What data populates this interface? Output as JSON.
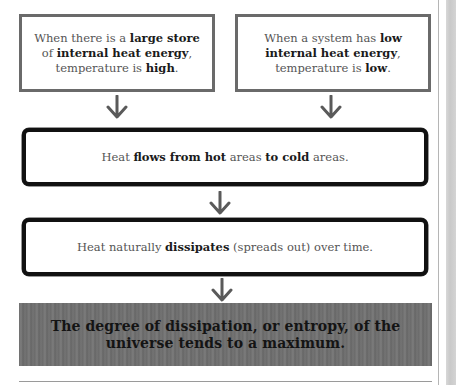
{
  "diagram": {
    "boxes": {
      "high_energy": {
        "prefix": "When there is a ",
        "bold1": "large store",
        "mid1": " of ",
        "bold2": "internal heat energy",
        "mid2": ", temperature is ",
        "bold3": "high",
        "suffix": "."
      },
      "low_energy": {
        "prefix": "When a system has ",
        "bold1": "low internal heat energy",
        "mid1": ", temperature is ",
        "bold2": "low",
        "suffix": "."
      },
      "heat_flow": {
        "prefix": "Heat ",
        "bold1": "flows from hot",
        "mid1": " areas ",
        "bold2": "to cold",
        "suffix": " areas."
      },
      "dissipation": {
        "prefix": "Heat naturally ",
        "bold1": "dissipates",
        "suffix": " (spreads out) over time."
      }
    },
    "conclusion": "The degree of dissipation, or entropy, of the universe tends to a maximum.",
    "arrows": [
      {
        "from": "high_energy",
        "to": "heat_flow"
      },
      {
        "from": "low_energy",
        "to": "heat_flow"
      },
      {
        "from": "heat_flow",
        "to": "dissipation"
      },
      {
        "from": "dissipation",
        "to": "conclusion"
      }
    ],
    "colors": {
      "arrow": "#5a5a5a",
      "top_box_border": "#6a6a6a",
      "wide_box_border": "#111111",
      "banner_bg": "#707070",
      "banner_text": "#141414"
    }
  }
}
